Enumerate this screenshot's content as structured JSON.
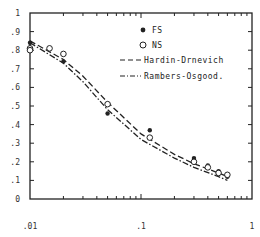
{
  "chart_data": {
    "type": "scatter",
    "title": "",
    "xlabel": "",
    "ylabel": "",
    "xscale": "log",
    "xlim": [
      0.01,
      1
    ],
    "ylim": [
      0,
      1
    ],
    "grid": false,
    "legend_position": "upper right (inside)",
    "x_tick_labels": [
      ".01",
      ".1",
      "1"
    ],
    "y_tick_labels": [
      "0",
      ".1",
      ".2",
      ".3",
      ".4",
      ".5",
      ".6",
      ".7",
      ".8",
      ".9",
      "1"
    ],
    "series": [
      {
        "name": "FS",
        "marker": "filled-circle",
        "x": [
          0.01,
          0.015,
          0.02,
          0.05,
          0.12,
          0.3,
          0.4,
          0.5,
          0.6
        ],
        "y": [
          0.84,
          0.81,
          0.74,
          0.46,
          0.37,
          0.22,
          0.18,
          0.15,
          0.12
        ]
      },
      {
        "name": "NS",
        "marker": "open-circle",
        "x": [
          0.01,
          0.01,
          0.015,
          0.02,
          0.05,
          0.12,
          0.3,
          0.4,
          0.5,
          0.6
        ],
        "y": [
          0.81,
          0.8,
          0.81,
          0.78,
          0.51,
          0.33,
          0.2,
          0.17,
          0.14,
          0.13
        ]
      },
      {
        "name": "Hardin-Drnevich",
        "line": "dashed",
        "x": [
          0.01,
          0.02,
          0.03,
          0.05,
          0.1,
          0.2,
          0.3,
          0.5,
          0.6
        ],
        "y": [
          0.85,
          0.75,
          0.66,
          0.52,
          0.35,
          0.24,
          0.19,
          0.14,
          0.12
        ]
      },
      {
        "name": "Rambers-Osgood",
        "line": "dash-dot",
        "x": [
          0.01,
          0.02,
          0.03,
          0.05,
          0.1,
          0.2,
          0.3,
          0.5,
          0.6
        ],
        "y": [
          0.84,
          0.73,
          0.63,
          0.48,
          0.32,
          0.22,
          0.17,
          0.12,
          0.1
        ]
      }
    ]
  },
  "legend": {
    "items": [
      {
        "label": "FS",
        "symbol": "filled-circle"
      },
      {
        "label": "NS",
        "symbol": "open-circle"
      },
      {
        "label": "Hardin-Drnevich",
        "symbol": "dashed-line"
      },
      {
        "label": "Rambers-Osgood.",
        "symbol": "dash-dot-line"
      }
    ]
  },
  "axes": {
    "x": {
      "ticks": [
        ".01",
        ".1",
        "1"
      ]
    },
    "y": {
      "ticks": [
        "0",
        ".1",
        ".2",
        ".3",
        ".4",
        ".5",
        ".6",
        ".7",
        ".8",
        ".9",
        "1"
      ]
    }
  },
  "colors": {
    "ink": "#222222",
    "background": "#ffffff"
  }
}
